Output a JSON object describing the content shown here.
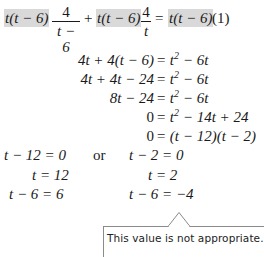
{
  "equation": {
    "line1": {
      "term1_highlight": "t(t − 6)",
      "frac1_num": "4",
      "frac1_den": "t − 6",
      "plus": "+",
      "term2_highlight": "t(t − 6)",
      "frac2_num": "4",
      "frac2_den": "t",
      "equals": "=",
      "term3_highlight": "t(t − 6)",
      "tail": "(1)"
    },
    "steps": [
      {
        "lhs": "4t + 4(t − 6)",
        "rhs_pre": "= t",
        "sup": "2",
        "rhs_post": " − 6t"
      },
      {
        "lhs": "4t + 4t − 24",
        "rhs_pre": "= t",
        "sup": "2",
        "rhs_post": " − 6t"
      },
      {
        "lhs": "8t − 24",
        "rhs_pre": "= t",
        "sup": "2",
        "rhs_post": " − 6t"
      },
      {
        "lhs": "0",
        "rhs_pre": "= t",
        "sup": "2",
        "rhs_post": " − 14t + 24"
      },
      {
        "lhs": "0",
        "rhs_pre": "= (t − 12)(t − 2)",
        "sup": "",
        "rhs_post": ""
      }
    ],
    "cases": {
      "or_label": "or",
      "left": [
        "t − 12 = 0",
        "t = 12",
        "t − 6 = 6"
      ],
      "right": [
        "t − 2 = 0",
        "t = 2",
        "t − 6 = −4"
      ]
    }
  },
  "callout": {
    "text": "This value is not appropriate."
  },
  "colors": {
    "highlight": "#d9d9d9",
    "text": "#1a1a1a",
    "callout_border": "#8a8a8a"
  }
}
